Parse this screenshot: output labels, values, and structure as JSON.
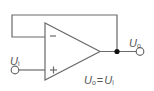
{
  "diagram": {
    "colors": {
      "line": "#6a6a6a",
      "text": "#555555",
      "background": "#ffffff",
      "node": "#111111"
    },
    "opamp": {
      "inverting_input_symbol": "−",
      "noninverting_input_symbol": "+"
    },
    "labels": {
      "input": {
        "main": "U",
        "sub": "i"
      },
      "output": {
        "main": "U",
        "sub": "o"
      },
      "equation": {
        "lhs_main": "U",
        "lhs_sub": "o",
        "op": "=",
        "rhs_main": "U",
        "rhs_sub": "i"
      }
    }
  }
}
